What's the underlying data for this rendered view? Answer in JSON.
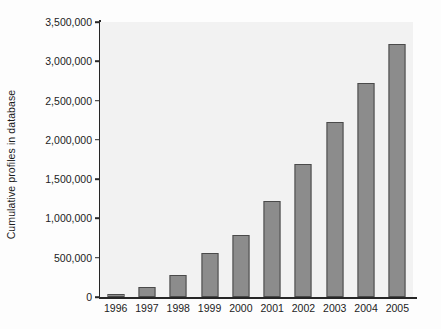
{
  "chart_data": {
    "type": "bar",
    "title": "",
    "xlabel": "",
    "ylabel": "Cumulative profiles in database",
    "categories": [
      "1996",
      "1997",
      "1998",
      "1999",
      "2000",
      "2001",
      "2002",
      "2003",
      "2004",
      "2005"
    ],
    "values": [
      40000,
      130000,
      280000,
      560000,
      790000,
      1220000,
      1690000,
      2230000,
      2720000,
      3220000
    ],
    "ylim": [
      0,
      3500000
    ],
    "ytick_values": [
      0,
      500000,
      1000000,
      1500000,
      2000000,
      2500000,
      3000000,
      3500000
    ],
    "ytick_labels": [
      "0",
      "500,000",
      "1,000,000",
      "1,500,000",
      "2,000,000",
      "2,500,000",
      "3,000,000",
      "3,500,000"
    ],
    "grid": false,
    "legend": false,
    "legend_position": "none",
    "bar_color": "#8c8c8c",
    "bar_edge_color": "#4a4a4a",
    "axis_color": "#262626",
    "plot_background": "#f2f2f2",
    "figure_background": "#fdfdfd"
  }
}
